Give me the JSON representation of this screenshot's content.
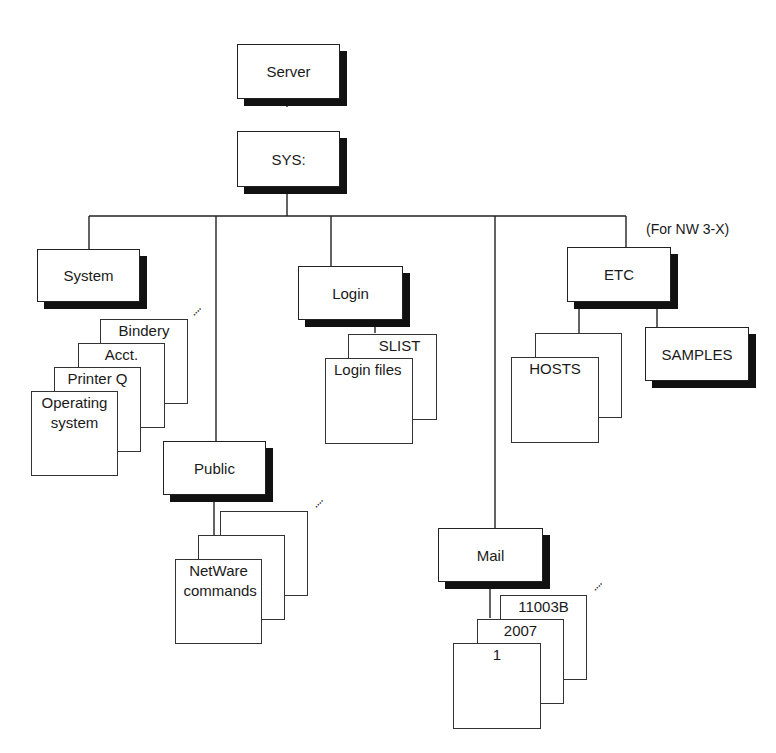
{
  "diagram": {
    "type": "directory-tree",
    "root": {
      "label": "Server"
    },
    "volume": {
      "label": "SYS:"
    },
    "note": "(For NW 3-X)",
    "ellipsis": "....",
    "directories": {
      "system": {
        "label": "System",
        "files": [
          "Bindery",
          "Acct.",
          "Printer Q",
          "Operating system"
        ]
      },
      "public": {
        "label": "Public",
        "files": [
          "NetWare commands"
        ]
      },
      "login": {
        "label": "Login",
        "files": [
          "SLIST",
          "Login files"
        ]
      },
      "mail": {
        "label": "Mail",
        "files": [
          "11003B",
          "2007",
          "1"
        ]
      },
      "etc": {
        "label": "ETC",
        "files": [
          "HOSTS"
        ],
        "subdirs": [
          "SAMPLES"
        ]
      }
    }
  }
}
